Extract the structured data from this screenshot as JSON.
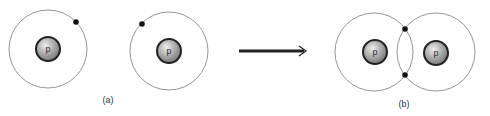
{
  "diagram": {
    "colors": {
      "orbit": "#8a8a8a",
      "electron": "#111111",
      "nucleus_outline": "#222222",
      "nucleus_fill_light": "#e6e6e6",
      "nucleus_fill_mid": "#a9a9a9",
      "nucleus_fill_dark": "#6f6f6f",
      "arrow": "#222222",
      "label": "#333333"
    },
    "panel_a": {
      "label": "(a)",
      "atoms": [
        {
          "name": "hydrogen-atom-1",
          "orbit": {
            "cx": 48,
            "cy": 49,
            "r": 39
          },
          "nucleus": {
            "cx": 48,
            "cy": 49,
            "r": 12,
            "symbol": "p"
          },
          "electrons": [
            {
              "cx": 76,
              "cy": 22
            }
          ]
        },
        {
          "name": "hydrogen-atom-2",
          "orbit": {
            "cx": 169,
            "cy": 51,
            "r": 39
          },
          "nucleus": {
            "cx": 169,
            "cy": 51,
            "r": 12,
            "symbol": "p"
          },
          "electrons": [
            {
              "cx": 142,
              "cy": 24
            }
          ]
        }
      ]
    },
    "arrow": {
      "x1": 239,
      "y1": 51,
      "x2": 306,
      "y2": 51
    },
    "panel_b": {
      "label": "(b)",
      "atoms": [
        {
          "name": "bonded-atom-left",
          "orbit": {
            "cx": 374,
            "cy": 52,
            "r": 39
          },
          "nucleus": {
            "cx": 375,
            "cy": 52,
            "r": 12,
            "symbol": "p"
          }
        },
        {
          "name": "bonded-atom-right",
          "orbit": {
            "cx": 436,
            "cy": 52,
            "r": 39
          },
          "nucleus": {
            "cx": 436,
            "cy": 53,
            "r": 12,
            "symbol": "p"
          }
        }
      ],
      "shared_electrons": [
        {
          "cx": 405,
          "cy": 29
        },
        {
          "cx": 405,
          "cy": 75
        }
      ]
    }
  }
}
